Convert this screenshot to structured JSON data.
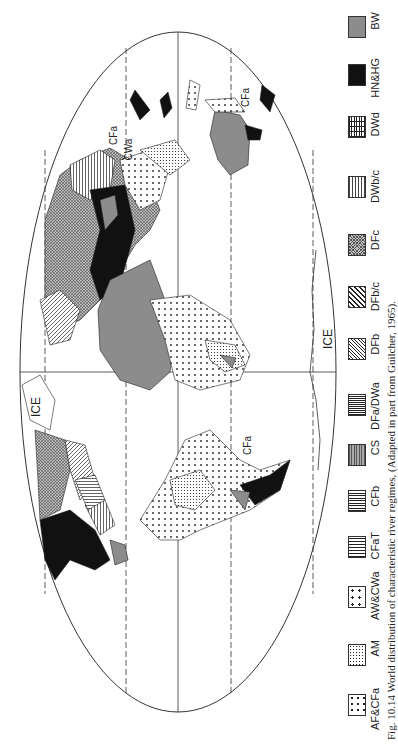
{
  "figure": {
    "caption": "Fig. 10.14 World distribution of characteristic river regimes, (Adapted in part from Guilcher, 1965).",
    "orientation": "rotated 90° counter-clockwise",
    "projection": "Mollweide-type elliptical world map"
  },
  "map_labels": [
    {
      "text": "CFa",
      "note": "Asia/China coast"
    },
    {
      "text": "CWa",
      "note": "Asia"
    },
    {
      "text": "CFa",
      "note": "Australia east coast"
    },
    {
      "text": "CFa",
      "note": "South America east coast"
    },
    {
      "text": "ICE",
      "note": "Greenland"
    },
    {
      "text": "ICE",
      "note": "Antarctica"
    }
  ],
  "legend": {
    "items": [
      {
        "code": "AF&CFa",
        "pattern": "sparse-dots",
        "color": "#ffffff"
      },
      {
        "code": "AM",
        "pattern": "dense-dots",
        "color": "#ffffff"
      },
      {
        "code": "AW&CWa",
        "pattern": "large-dots",
        "color": "#ffffff"
      },
      {
        "code": "CFaT",
        "pattern": "vertical-lines",
        "color": "#ffffff"
      },
      {
        "code": "CFb",
        "pattern": "vertical-lines-bold",
        "color": "#ffffff"
      },
      {
        "code": "CS",
        "pattern": "horizontal-lines-grey",
        "color": "#9a9a9a"
      },
      {
        "code": "DFa/DWa",
        "pattern": "dense-vertical-lines",
        "color": "#ffffff"
      },
      {
        "code": "DFb",
        "pattern": "diagonal-fine",
        "color": "#ffffff"
      },
      {
        "code": "DFb/c",
        "pattern": "diagonal-wide",
        "color": "#ffffff"
      },
      {
        "code": "DFc",
        "pattern": "crosshatch-fine",
        "color": "#b8b8b8"
      },
      {
        "code": "DWb/c",
        "pattern": "horizontal-dashes",
        "color": "#ffffff"
      },
      {
        "code": "DWd",
        "pattern": "grid",
        "color": "#ffffff"
      },
      {
        "code": "HN&HG",
        "pattern": "solid",
        "color": "#111111"
      },
      {
        "code": "BW",
        "pattern": "solid-grey",
        "color": "#8c8c8c"
      }
    ]
  },
  "colors": {
    "outline": "#333333",
    "black_fill": "#111111",
    "grey_fill": "#8c8c8c",
    "background": "#ffffff"
  }
}
